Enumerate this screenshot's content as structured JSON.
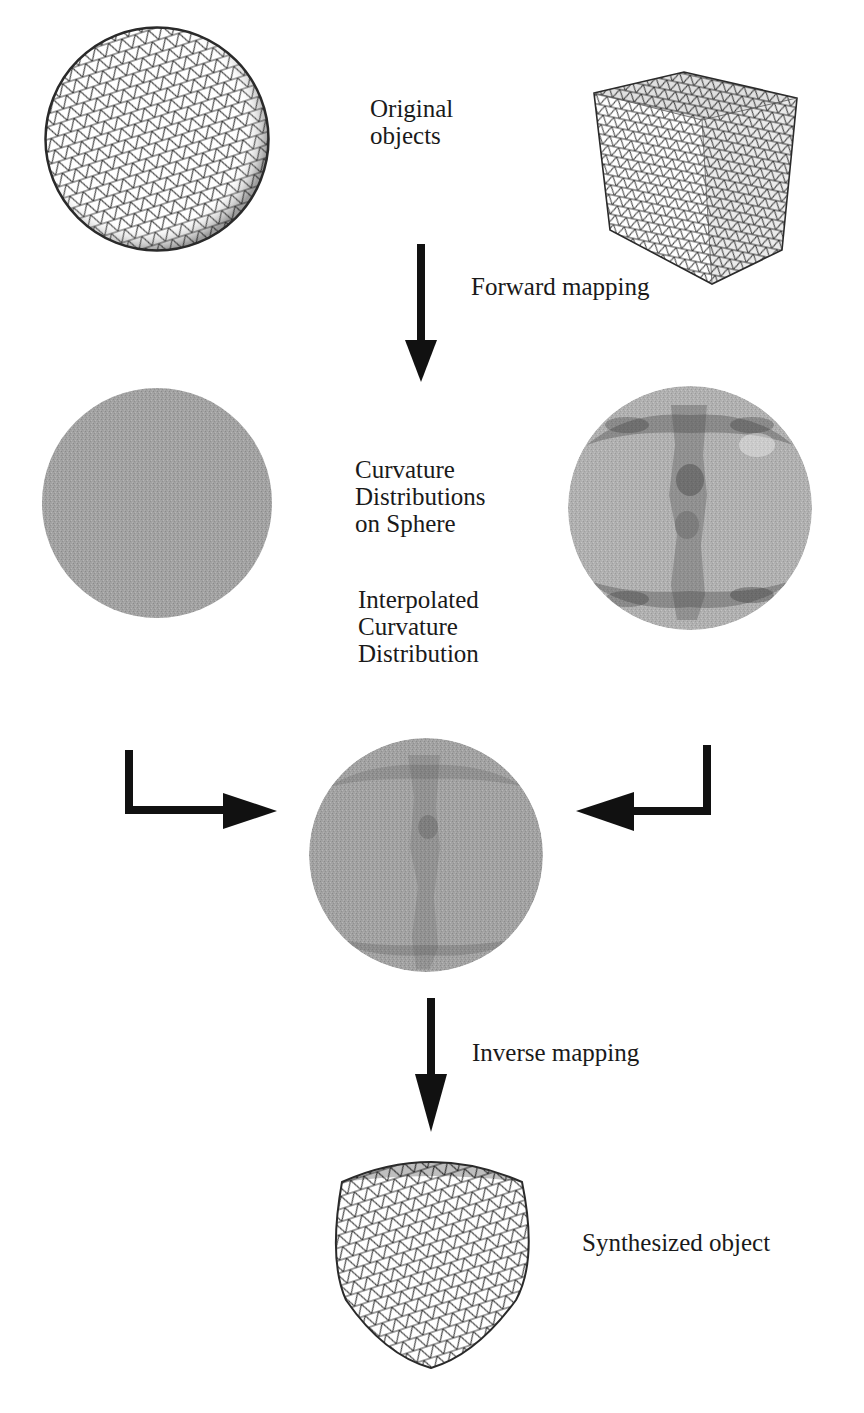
{
  "diagram": {
    "labels": {
      "original_objects": "Original\nobjects",
      "forward_mapping": "Forward mapping",
      "curvature_distributions": "Curvature\nDistributions\non Sphere",
      "interpolated_distribution": "Interpolated\nCurvature\nDistribution",
      "inverse_mapping": "Inverse mapping",
      "synthesized_object": "Synthesized object"
    },
    "nodes": [
      {
        "id": "sphere-mesh",
        "kind": "wireframe-sphere",
        "stage": "original"
      },
      {
        "id": "cube-mesh",
        "kind": "wireframe-cube",
        "stage": "original"
      },
      {
        "id": "sphere-curvature-map",
        "kind": "uniform-gray-disc",
        "stage": "curvature"
      },
      {
        "id": "cube-curvature-map",
        "kind": "patterned-gray-disc",
        "stage": "curvature"
      },
      {
        "id": "interpolated-curvature-map",
        "kind": "patterned-gray-disc",
        "stage": "interpolated"
      },
      {
        "id": "synthesized-mesh",
        "kind": "wireframe-rounded-cube",
        "stage": "synthesized"
      }
    ],
    "edges": [
      {
        "from": "original",
        "to": "curvature",
        "label": "Forward mapping"
      },
      {
        "from": "sphere-curvature-map",
        "to": "interpolated-curvature-map"
      },
      {
        "from": "cube-curvature-map",
        "to": "interpolated-curvature-map"
      },
      {
        "from": "interpolated",
        "to": "synthesized",
        "label": "Inverse mapping"
      }
    ],
    "colors": {
      "ink": "#1a1a1a",
      "disc_gray": "#9a9a9a",
      "disc_dark": "#6a6a6a",
      "mesh_line": "#3a3a3a"
    }
  }
}
